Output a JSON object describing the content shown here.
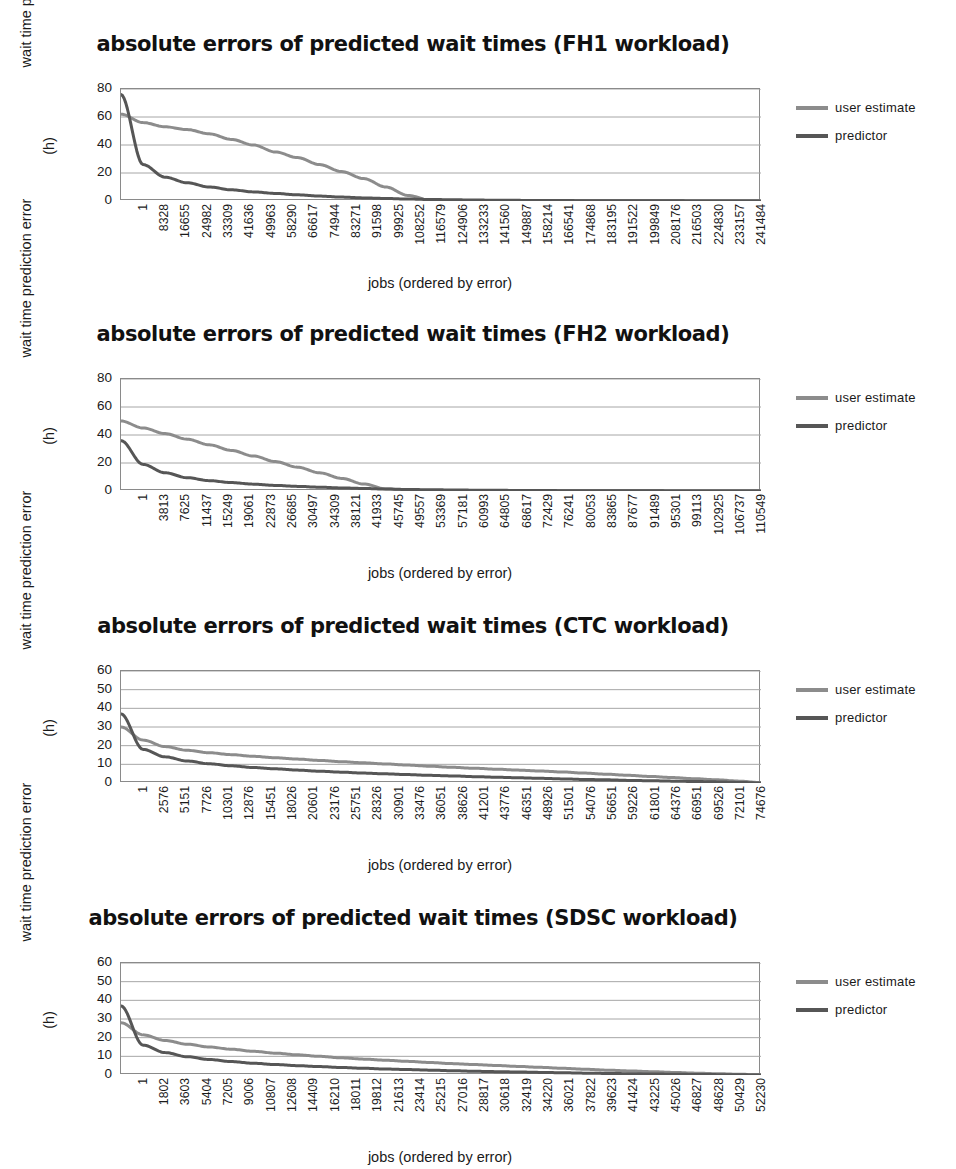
{
  "figure": {
    "axis_title_y_line1": "wait time prediction error",
    "axis_title_y_line2": "(h)",
    "axis_title_x": "jobs (ordered by error)",
    "legend": {
      "user_estimate_label": "user estimate",
      "predictor_label": "predictor",
      "user_estimate_color": "#8c8c8c",
      "predictor_color": "#565656"
    },
    "gridline_color": "#a6a6a6",
    "axis_border_color": "#8a8a8a"
  },
  "chart_data": [
    {
      "type": "line",
      "id": "fh1",
      "title": "absolute errors of predicted wait times (FH1 workload)",
      "xlabel": "jobs (ordered by error)",
      "ylabel": "wait time prediction error (h)",
      "ylim": [
        0,
        80
      ],
      "yticks": [
        0,
        20,
        40,
        60,
        80
      ],
      "grid": true,
      "legend_position": "right",
      "categories": [
        "1",
        "8328",
        "16655",
        "24982",
        "33309",
        "41636",
        "49963",
        "58290",
        "66617",
        "74944",
        "83271",
        "91598",
        "99925",
        "108252",
        "116579",
        "124906",
        "133233",
        "141560",
        "149887",
        "158214",
        "166541",
        "174868",
        "183195",
        "191522",
        "199849",
        "208176",
        "216503",
        "224830",
        "233157",
        "241484"
      ],
      "series": [
        {
          "name": "user estimate",
          "values": [
            62,
            56,
            53,
            51,
            48,
            44,
            40,
            35,
            31,
            26,
            21,
            16,
            10,
            4,
            0.6,
            0.3,
            0.2,
            0.15,
            0.1,
            0.1,
            0.08,
            0.06,
            0.05,
            0.04,
            0.03,
            0.03,
            0.02,
            0.02,
            0.01,
            0
          ]
        },
        {
          "name": "predictor",
          "values": [
            76,
            26,
            17,
            13,
            10,
            8,
            6.5,
            5.4,
            4.4,
            3.5,
            2.8,
            2.2,
            1.8,
            1.4,
            1.1,
            0.9,
            0.7,
            0.55,
            0.45,
            0.36,
            0.3,
            0.24,
            0.2,
            0.16,
            0.13,
            0.1,
            0.08,
            0.06,
            0.03,
            0
          ]
        }
      ]
    },
    {
      "type": "line",
      "id": "fh2",
      "title": "absolute errors of predicted wait times (FH2 workload)",
      "xlabel": "jobs (ordered by error)",
      "ylabel": "wait time prediction error (h)",
      "ylim": [
        0,
        80
      ],
      "yticks": [
        0,
        20,
        40,
        60,
        80
      ],
      "grid": true,
      "legend_position": "right",
      "categories": [
        "1",
        "3813",
        "7625",
        "11437",
        "15249",
        "19061",
        "22873",
        "26685",
        "30497",
        "34309",
        "38121",
        "41933",
        "45745",
        "49557",
        "53369",
        "57181",
        "60993",
        "64805",
        "68617",
        "72429",
        "76241",
        "80053",
        "83865",
        "87677",
        "91489",
        "95301",
        "99113",
        "102925",
        "106737",
        "110549"
      ],
      "series": [
        {
          "name": "user estimate",
          "values": [
            50,
            45,
            41,
            37,
            33,
            29,
            25,
            21,
            17,
            13,
            9,
            5,
            1.5,
            0.4,
            0.3,
            0.25,
            0.2,
            0.15,
            0.12,
            0.1,
            0.08,
            0.07,
            0.06,
            0.05,
            0.04,
            0.03,
            0.02,
            0.02,
            0.01,
            0
          ]
        },
        {
          "name": "predictor",
          "values": [
            36,
            19,
            13,
            9.5,
            7.4,
            6,
            4.9,
            4,
            3.3,
            2.7,
            2.2,
            1.8,
            1.4,
            1.1,
            0.9,
            0.75,
            0.6,
            0.5,
            0.4,
            0.32,
            0.26,
            0.21,
            0.17,
            0.14,
            0.11,
            0.08,
            0.06,
            0.04,
            0.02,
            0
          ]
        }
      ]
    },
    {
      "type": "line",
      "id": "ctc",
      "title": "absolute errors of predicted wait times (CTC workload)",
      "xlabel": "jobs (ordered by error)",
      "ylabel": "wait time prediction error (h)",
      "ylim": [
        0,
        60
      ],
      "yticks": [
        0,
        10,
        20,
        30,
        40,
        50,
        60
      ],
      "grid": true,
      "legend_position": "right",
      "categories": [
        "1",
        "2576",
        "5151",
        "7726",
        "10301",
        "12876",
        "15451",
        "18026",
        "20601",
        "23176",
        "25751",
        "28326",
        "30901",
        "33476",
        "36051",
        "38626",
        "41201",
        "43776",
        "46351",
        "48926",
        "51501",
        "54076",
        "56651",
        "59226",
        "61801",
        "64376",
        "66951",
        "69526",
        "72101",
        "74676"
      ],
      "series": [
        {
          "name": "user estimate",
          "values": [
            30,
            23,
            19.5,
            17.5,
            16.2,
            15.2,
            14.3,
            13.5,
            12.8,
            12.1,
            11.4,
            10.8,
            10.2,
            9.6,
            9.0,
            8.4,
            7.9,
            7.4,
            6.9,
            6.4,
            5.9,
            5.3,
            4.7,
            4.1,
            3.5,
            2.9,
            2.3,
            1.7,
            1.0,
            0.2
          ]
        },
        {
          "name": "predictor",
          "values": [
            37,
            18,
            14,
            11.8,
            10.3,
            9.2,
            8.3,
            7.6,
            6.9,
            6.3,
            5.8,
            5.3,
            4.9,
            4.5,
            4.1,
            3.8,
            3.4,
            3.1,
            2.8,
            2.5,
            2.2,
            1.9,
            1.7,
            1.4,
            1.2,
            1.0,
            0.8,
            0.6,
            0.3,
            0
          ]
        }
      ]
    },
    {
      "type": "line",
      "id": "sdsc",
      "title": "absolute errors of predicted wait times (SDSC workload)",
      "xlabel": "jobs (ordered by error)",
      "ylabel": "wait time prediction error (h)",
      "ylim": [
        0,
        60
      ],
      "yticks": [
        0,
        10,
        20,
        30,
        40,
        50,
        60
      ],
      "grid": true,
      "legend_position": "right",
      "categories": [
        "1",
        "1802",
        "3603",
        "5404",
        "7205",
        "9006",
        "10807",
        "12608",
        "14409",
        "16210",
        "18011",
        "19812",
        "21613",
        "23414",
        "25215",
        "27016",
        "28817",
        "30618",
        "32419",
        "34220",
        "36021",
        "37822",
        "39623",
        "41424",
        "43225",
        "45026",
        "46827",
        "48628",
        "50429",
        "52230"
      ],
      "series": [
        {
          "name": "user estimate",
          "values": [
            28,
            21.5,
            18.5,
            16.5,
            15.0,
            13.8,
            12.7,
            11.7,
            10.8,
            10.0,
            9.2,
            8.5,
            7.9,
            7.3,
            6.7,
            6.1,
            5.6,
            5.1,
            4.6,
            4.1,
            3.6,
            3.1,
            2.6,
            2.2,
            1.8,
            1.4,
            1.0,
            0.7,
            0.4,
            0.1
          ]
        },
        {
          "name": "predictor",
          "values": [
            37,
            16,
            12,
            9.8,
            8.3,
            7.2,
            6.3,
            5.6,
            5.0,
            4.5,
            4.0,
            3.6,
            3.2,
            2.9,
            2.6,
            2.3,
            2.0,
            1.8,
            1.6,
            1.4,
            1.2,
            1.0,
            0.85,
            0.7,
            0.55,
            0.42,
            0.3,
            0.2,
            0.1,
            0
          ]
        }
      ]
    }
  ]
}
